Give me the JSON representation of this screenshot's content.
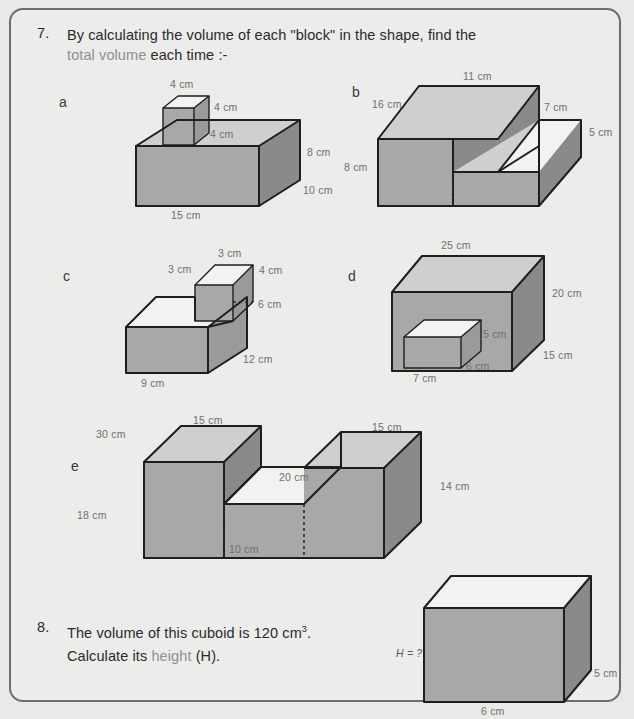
{
  "page": {
    "background_color": "#ececeb",
    "border_color": "#6d6d6d",
    "accent_color": "#8f8f8f"
  },
  "questions": [
    {
      "number": "7.",
      "line1_before": "By calculating the volume of each \"block\" in the shape, find the",
      "line2_highlight": "total volume",
      "line2_after": " each time :-"
    },
    {
      "number": "8.",
      "line1": "The volume of this cuboid is 120 cm",
      "line1_sup": "3",
      "line1_end": ".",
      "line2_before": "Calculate its ",
      "line2_highlight": "height",
      "line2_after": " (H)."
    }
  ],
  "shapes": {
    "a": {
      "letter": "a",
      "labels": {
        "cube_top": "4 cm",
        "cube_right": "4 cm",
        "cube_depth": "4 cm",
        "base_height": "8 cm",
        "base_depth": "10 cm",
        "base_width": "15 cm"
      }
    },
    "b": {
      "letter": "b",
      "labels": {
        "top_width": "11 cm",
        "depth": "16 cm",
        "step_top": "7 cm",
        "step_height": "5 cm",
        "height": "8 cm"
      }
    },
    "c": {
      "letter": "c",
      "labels": {
        "block_depth": "3 cm",
        "block_top": "3 cm",
        "block_height": "4 cm",
        "base_height": "6 cm",
        "base_depth": "12 cm",
        "base_width": "9 cm"
      }
    },
    "d": {
      "letter": "d",
      "labels": {
        "top_width": "25 cm",
        "height": "20 cm",
        "depth": "15 cm",
        "block_height": "5 cm",
        "block_depth": "6 cm",
        "block_width": "7 cm"
      }
    },
    "e": {
      "letter": "e",
      "labels": {
        "left_depth": "30 cm",
        "left_top": "15 cm",
        "middle_top": "20 cm",
        "right_top": "15 cm",
        "right_height": "14 cm",
        "left_height": "18 cm",
        "middle_height": "10 cm"
      }
    },
    "q8": {
      "labels": {
        "height": "H = ?",
        "depth": "5 cm",
        "width": "6 cm"
      }
    }
  }
}
